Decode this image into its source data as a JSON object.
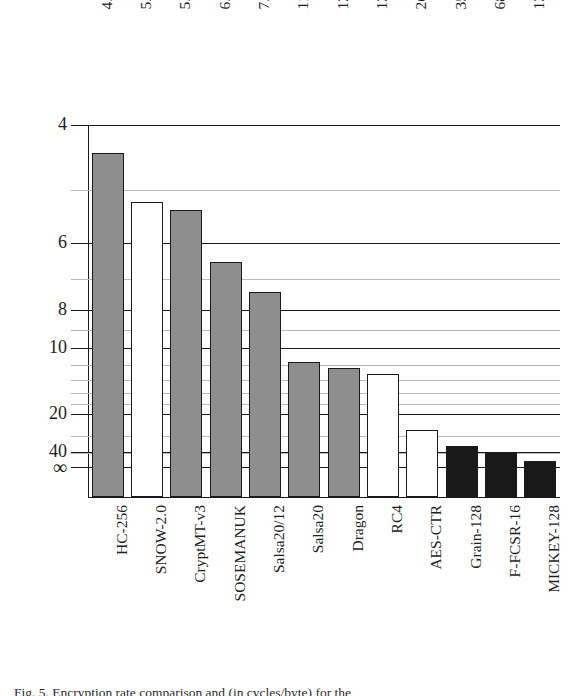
{
  "chart_data": {
    "type": "bar",
    "title": "",
    "xlabel": "",
    "ylabel": "",
    "categories": [
      "HC-256",
      "SNOW-2.0",
      "CryptMT-v3",
      "SOSEMANUK",
      "Salsa20/12",
      "Salsa20",
      "Dragon",
      "RC4",
      "AES-CTR",
      "Grain-128",
      "F-FCSR-16",
      "MICKEY-128"
    ],
    "values": [
      4.4,
      5.21,
      5.36,
      6.52,
      7.41,
      11.64,
      12.39,
      13.12,
      26.86,
      35.89,
      68.05,
      1370.78
    ],
    "value_labels": [
      "4.40",
      "5.21",
      "5.36",
      "6.52",
      "7.41",
      "11.64",
      "12.39",
      "13.12",
      "26.86",
      "35.89",
      "68.05",
      "1370.78"
    ],
    "bar_styles": [
      "gray",
      "white",
      "gray",
      "gray",
      "gray",
      "gray",
      "gray",
      "white",
      "white",
      "black",
      "black",
      "black"
    ],
    "scale": "reversed-log",
    "grid": true,
    "legend": "none",
    "ytick_labels": [
      "4",
      "6",
      "8",
      "10",
      "20",
      "40",
      "∞"
    ],
    "ytick_values": [
      4,
      6,
      8,
      10,
      20,
      40,
      10000
    ],
    "yminor_values": [
      5,
      7,
      9,
      12,
      14,
      16,
      18,
      30,
      60
    ],
    "ylim": [
      4,
      10000
    ],
    "axis_note": "cycles/byte, lower is faster"
  },
  "caption": {
    "text": "Fig. 5. Encryption rate comparison and (in cycles/byte) for the"
  },
  "colors": {
    "gray_fill": "#8e8e8e",
    "white_fill": "#ffffff",
    "black_fill": "#1a1a1a",
    "axis": "#1a1a1a",
    "grid_minor": "#b9b9b9"
  }
}
